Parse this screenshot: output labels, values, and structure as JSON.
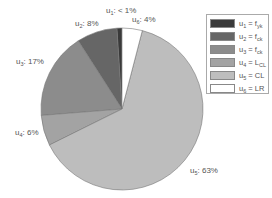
{
  "chart_data": {
    "type": "pie",
    "title": "",
    "start_angle_deg": 0,
    "direction": "counterclockwise-from-top",
    "slices": [
      {
        "id": "u1",
        "label": "u1: < 1%",
        "sub": "1",
        "pct_text": "< 1%",
        "value": 1,
        "legend": "u1 = fyk",
        "legend_var": "f",
        "legend_sub": "yk",
        "color": "#3a3a3a"
      },
      {
        "id": "u2",
        "label": "u2: 8%",
        "sub": "2",
        "pct_text": "8%",
        "value": 8,
        "legend": "u2 = fck",
        "legend_var": "f",
        "legend_sub": "ck",
        "color": "#666666"
      },
      {
        "id": "u3",
        "label": "u3: 17%",
        "sub": "3",
        "pct_text": "17%",
        "value": 17,
        "legend": "u3 = fck",
        "legend_var": "f",
        "legend_sub": "ck",
        "color": "#8c8c8c"
      },
      {
        "id": "u4",
        "label": "u4: 6%",
        "sub": "4",
        "pct_text": "6%",
        "value": 6,
        "legend": "u4 = LCL",
        "legend_var": "L",
        "legend_sub": "CL",
        "color": "#a3a3a3"
      },
      {
        "id": "u5",
        "label": "u5: 63%",
        "sub": "5",
        "pct_text": "63%",
        "value": 63,
        "legend": "u5 = CL",
        "legend_var": "CL",
        "legend_sub": "",
        "color": "#bdbdbd"
      },
      {
        "id": "u6",
        "label": "u6: 4%",
        "sub": "6",
        "pct_text": "4%",
        "value": 4,
        "legend": "u6 = LR",
        "legend_var": "LR",
        "legend_sub": "",
        "color": "#ffffff"
      }
    ],
    "legend_position": "upper-right"
  }
}
